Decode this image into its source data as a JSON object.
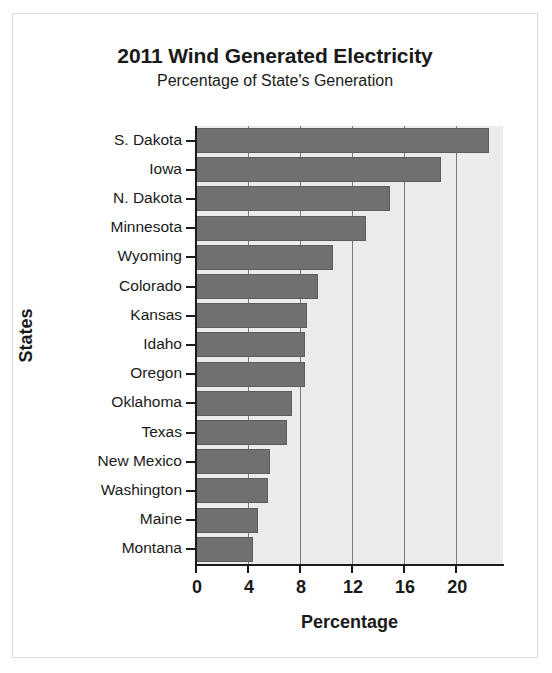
{
  "chart_data": {
    "type": "bar",
    "orientation": "horizontal",
    "title": "2011 Wind Generated Electricity",
    "subtitle": "Percentage of State's Generation",
    "xlabel": "Percentage",
    "ylabel": "States",
    "categories": [
      "S. Dakota",
      "Iowa",
      "N. Dakota",
      "Minnesota",
      "Wyoming",
      "Colorado",
      "Kansas",
      "Idaho",
      "Oregon",
      "Oklahoma",
      "Texas",
      "New Mexico",
      "Washington",
      "Maine",
      "Montana"
    ],
    "values": [
      22.5,
      18.8,
      14.9,
      13.1,
      10.5,
      9.4,
      8.5,
      8.4,
      8.4,
      7.4,
      7.0,
      5.7,
      5.5,
      4.8,
      4.4
    ],
    "xticks": [
      0,
      4,
      8,
      12,
      16,
      20
    ],
    "xtick_labels": [
      "0",
      "4",
      "8",
      "12",
      "16",
      "20"
    ],
    "xlim": [
      0,
      23.6
    ],
    "grid": "vertical",
    "legend": "none",
    "bar_color": "#707070",
    "plot_background": "#ebebeb",
    "gridline_color": "#7a7a7a",
    "axis_color": "#1a1a1a",
    "figure_background": "#ffffff"
  }
}
